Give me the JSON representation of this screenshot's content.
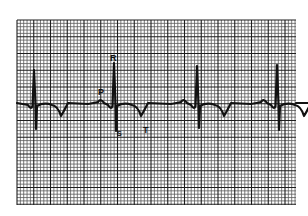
{
  "figure": {
    "type": "ecg-strip",
    "background": "#ffffff",
    "grid": {
      "x0": 17,
      "y0": 20,
      "x1": 296,
      "y1": 205,
      "minor_spacing": 3.35,
      "major_every": 5,
      "minor_color": "#5a5a5a",
      "major_color": "#1e1e1e"
    },
    "trace_color": "#111111",
    "baseline_y": 104,
    "beats": [
      {
        "r_x": 34,
        "r_y": 70,
        "s_y": 129
      },
      {
        "r_x": 114,
        "r_y": 63,
        "s_y": 131
      },
      {
        "r_x": 197,
        "r_y": 66,
        "s_y": 128
      },
      {
        "r_x": 277,
        "r_y": 65,
        "s_y": 130
      }
    ],
    "labels": [
      {
        "id": "R",
        "text": "R",
        "x": 110,
        "y": 54,
        "size": 9
      },
      {
        "id": "P",
        "text": "P",
        "x": 98,
        "y": 88,
        "size": 9
      },
      {
        "id": "S",
        "text": "S",
        "x": 117,
        "y": 130,
        "size": 7
      },
      {
        "id": "T",
        "text": "T",
        "x": 143,
        "y": 126,
        "size": 9
      }
    ]
  }
}
